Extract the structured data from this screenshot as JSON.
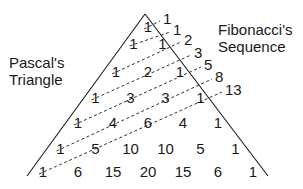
{
  "labels": {
    "left_line1": "Pascal's",
    "left_line2": "Triangle",
    "right_line1": "Fibonacci's",
    "right_line2": "Sequence"
  },
  "pascal_rows": [
    [
      1
    ],
    [
      1,
      1
    ],
    [
      1,
      2,
      1
    ],
    [
      1,
      3,
      3,
      1
    ],
    [
      1,
      4,
      6,
      4,
      1
    ],
    [
      1,
      5,
      10,
      10,
      5,
      1
    ],
    [
      1,
      6,
      15,
      20,
      15,
      6,
      1
    ]
  ],
  "fibonacci": [
    1,
    1,
    2,
    3,
    5,
    8,
    13
  ],
  "colors": {
    "ink": "#1a1a1a",
    "background": "#ffffff"
  }
}
